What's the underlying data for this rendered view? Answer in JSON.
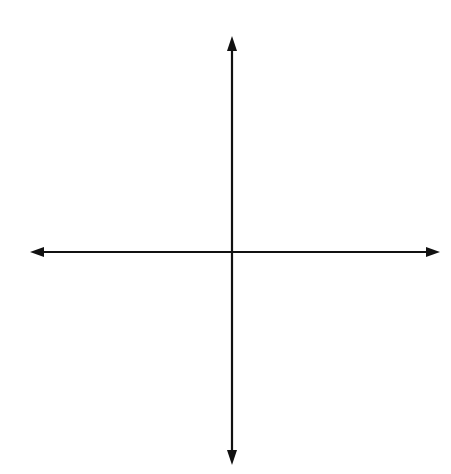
{
  "problem": {
    "number": "33."
  },
  "axes": {
    "x_label": "x",
    "y_label": "y"
  },
  "grid": {
    "x_min": -8,
    "x_max": 8,
    "y_min": -8,
    "y_max": 8,
    "step": 1
  },
  "colors": {
    "curve": "#3a5fae",
    "grid": "#9a9a9a",
    "axis": "#111111"
  },
  "chart_data": {
    "type": "line",
    "title": "33.",
    "xlabel": "x",
    "ylabel": "y",
    "xlim": [
      -8,
      8
    ],
    "ylim": [
      -8,
      8
    ],
    "grid": true,
    "series": [
      {
        "name": "parabola",
        "description": "upward-opening parabola, vertex (0,-1), arrows at ends",
        "vertex": [
          0,
          -1
        ],
        "endpoints": [
          [
            -4,
            6
          ],
          [
            4,
            6
          ]
        ],
        "x": [
          -4,
          -3,
          -2,
          -1,
          0,
          1,
          2,
          3,
          4
        ],
        "y": [
          6,
          2.94,
          0.75,
          -0.56,
          -1,
          -0.56,
          0.75,
          2.94,
          6
        ]
      }
    ]
  }
}
